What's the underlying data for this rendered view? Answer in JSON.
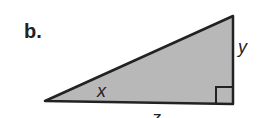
{
  "figure": {
    "part_label": "b.",
    "shape": "right-triangle",
    "fill_color": "#b8b8b8",
    "stroke_color": "#222222",
    "labels": {
      "x": "x",
      "y": "y",
      "z": "z"
    },
    "right_angle_marker": true
  }
}
